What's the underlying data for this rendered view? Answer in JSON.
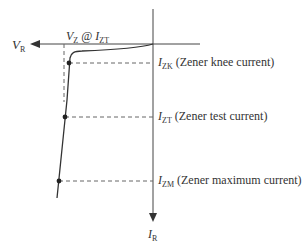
{
  "diagram": {
    "axes": {
      "horizontal": {
        "label_main": "V",
        "label_sub": "R"
      },
      "vertical": {
        "label_main": "I",
        "label_sub": "R"
      }
    },
    "vz_label": {
      "v": "V",
      "v_sub": "Z",
      "at": " @ ",
      "i": "I",
      "i_sub": "ZT"
    },
    "points": [
      {
        "main": "I",
        "sub": "ZK",
        "desc": " (Zener knee current)"
      },
      {
        "main": "I",
        "sub": "ZT",
        "desc": " (Zener test current)"
      },
      {
        "main": "I",
        "sub": "ZM",
        "desc": " (Zener maximum current)"
      }
    ],
    "colors": {
      "line": "#333333",
      "dash": "#555555",
      "background": "#ffffff"
    }
  }
}
